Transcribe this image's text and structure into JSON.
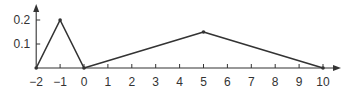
{
  "chart_data": {
    "type": "line",
    "title": "",
    "xlabel": "",
    "ylabel": "",
    "x": [
      -2,
      -1,
      0,
      5,
      10
    ],
    "series": [
      {
        "name": "f(x)",
        "values": [
          0,
          0.2,
          0,
          0.15,
          0
        ],
        "color": "#333333"
      }
    ],
    "x_ticks": [
      -2,
      -1,
      0,
      1,
      2,
      3,
      4,
      5,
      6,
      7,
      8,
      9,
      10
    ],
    "x_tick_labels": [
      "−2",
      "−1",
      "0",
      "1",
      "2",
      "3",
      "4",
      "5",
      "6",
      "7",
      "8",
      "9",
      "10"
    ],
    "y_ticks": [
      0.1,
      0.2
    ],
    "y_tick_labels": [
      "0.1",
      "0.2"
    ],
    "xlim": [
      -2,
      10.6
    ],
    "ylim": [
      0,
      0.27
    ],
    "grid": false,
    "legend": "none",
    "axis_arrows": true
  }
}
